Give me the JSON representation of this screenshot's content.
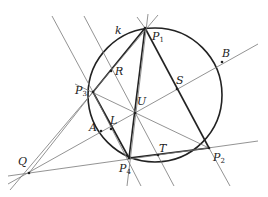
{
  "diagram": {
    "type": "projective geometry figure",
    "circle_label": "k",
    "points": [
      {
        "id": "P1",
        "name": "P",
        "sub": "1",
        "x": 145,
        "y": 28,
        "lx": 152,
        "ly": 40
      },
      {
        "id": "P2",
        "name": "P",
        "sub": "2",
        "x": 209,
        "y": 148,
        "lx": 213,
        "ly": 161
      },
      {
        "id": "P3",
        "name": "P",
        "sub": "3",
        "x": 93,
        "y": 92,
        "lx": 75,
        "ly": 94
      },
      {
        "id": "P4",
        "name": "P",
        "sub": "4",
        "x": 129,
        "y": 158,
        "lx": 119,
        "ly": 172
      },
      {
        "id": "R",
        "name": "R",
        "sub": "",
        "x": 111,
        "y": 71,
        "lx": 115,
        "ly": 75
      },
      {
        "id": "S",
        "name": "S",
        "sub": "",
        "x": 177,
        "y": 89,
        "lx": 176,
        "ly": 84
      },
      {
        "id": "U",
        "name": "U",
        "sub": "",
        "x": 135,
        "y": 113,
        "lx": 137,
        "ly": 105
      },
      {
        "id": "L",
        "name": "L",
        "sub": "",
        "x": 111,
        "y": 129,
        "lx": 110,
        "ly": 124
      },
      {
        "id": "A",
        "name": "A",
        "sub": "",
        "x": 101,
        "y": 131,
        "lx": 89,
        "ly": 131
      },
      {
        "id": "T",
        "name": "T",
        "sub": "",
        "x": 158,
        "y": 155,
        "lx": 159,
        "ly": 152
      },
      {
        "id": "B",
        "name": "B",
        "sub": "",
        "x": 222,
        "y": 62,
        "lx": 222,
        "ly": 57
      },
      {
        "id": "Q",
        "name": "Q",
        "sub": "",
        "x": 29,
        "y": 173,
        "lx": 18,
        "ly": 165
      }
    ],
    "k_label": {
      "text": "k",
      "x": 115,
      "y": 34
    }
  }
}
